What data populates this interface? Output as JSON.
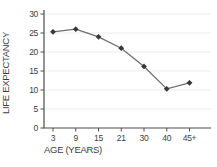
{
  "chart_data": {
    "type": "line",
    "categories": [
      "3",
      "9",
      "15",
      "21",
      "30",
      "40",
      "45+"
    ],
    "values": [
      25.3,
      26,
      24,
      21,
      16.2,
      10.3,
      11.9
    ],
    "title": "",
    "xlabel": "AGE (YEARS)",
    "ylabel": "LIFE EXPECTANCY",
    "ylim": [
      0,
      30
    ],
    "yticks": [
      0,
      5,
      10,
      15,
      20,
      25,
      30
    ],
    "grid": true,
    "legend": false,
    "marker": "diamond",
    "colors": {
      "line": "#6e6e6e",
      "marker": "#383838",
      "axis": "#4d4d4d",
      "grid": "#ececec",
      "text": "#3d3d3d",
      "background": "#ffffff"
    }
  }
}
